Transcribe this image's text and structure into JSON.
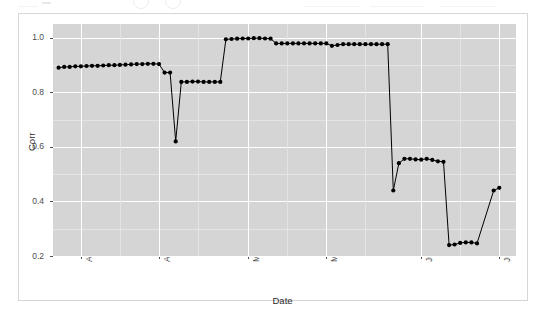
{
  "chart_data": {
    "type": "line",
    "title": "",
    "subtitle": "",
    "xlabel": "Date",
    "ylabel": "Corr",
    "ylim": [
      0.2,
      1.05
    ],
    "yticks": [
      "0.2",
      "0.4",
      "0.6",
      "0.8",
      "1.0"
    ],
    "ytick_values": [
      0.2,
      0.4,
      0.6,
      0.8,
      1.0
    ],
    "xticks": [
      "Apr 01",
      "Apr 15",
      "May 01",
      "May 15",
      "Jun 01",
      "Jun 15"
    ],
    "xtick_dates": [
      "2020-04-01",
      "2020-04-15",
      "2020-05-01",
      "2020-05-15",
      "2020-06-01",
      "2020-06-15"
    ],
    "x_range": [
      "2020-03-27",
      "2020-06-18"
    ],
    "grid": true,
    "grid_major_color": "#ffffff",
    "grid_minor_color": "#e4e4e4",
    "panel_color": "#d5d5d5",
    "point_color": "#000000",
    "line_color": "#000000",
    "marker": "filled-circle",
    "legend": "none",
    "x": [
      "2020-03-28",
      "2020-03-29",
      "2020-03-30",
      "2020-03-31",
      "2020-04-01",
      "2020-04-02",
      "2020-04-03",
      "2020-04-04",
      "2020-04-05",
      "2020-04-06",
      "2020-04-07",
      "2020-04-08",
      "2020-04-09",
      "2020-04-10",
      "2020-04-11",
      "2020-04-12",
      "2020-04-13",
      "2020-04-14",
      "2020-04-15",
      "2020-04-16",
      "2020-04-17",
      "2020-04-18",
      "2020-04-19",
      "2020-04-20",
      "2020-04-21",
      "2020-04-22",
      "2020-04-23",
      "2020-04-24",
      "2020-04-25",
      "2020-04-26",
      "2020-04-27",
      "2020-04-28",
      "2020-04-29",
      "2020-04-30",
      "2020-05-01",
      "2020-05-02",
      "2020-05-03",
      "2020-05-04",
      "2020-05-05",
      "2020-05-06",
      "2020-05-07",
      "2020-05-08",
      "2020-05-09",
      "2020-05-10",
      "2020-05-11",
      "2020-05-12",
      "2020-05-13",
      "2020-05-14",
      "2020-05-15",
      "2020-05-16",
      "2020-05-17",
      "2020-05-18",
      "2020-05-19",
      "2020-05-20",
      "2020-05-21",
      "2020-05-22",
      "2020-05-23",
      "2020-05-24",
      "2020-05-25",
      "2020-05-26",
      "2020-05-27",
      "2020-05-28",
      "2020-05-29",
      "2020-05-30",
      "2020-05-31",
      "2020-06-01",
      "2020-06-02",
      "2020-06-03",
      "2020-06-04",
      "2020-06-05",
      "2020-06-06",
      "2020-06-07",
      "2020-06-08",
      "2020-06-09",
      "2020-06-10",
      "2020-06-11",
      "2020-06-14",
      "2020-06-15"
    ],
    "values": [
      0.89,
      0.893,
      0.893,
      0.895,
      0.895,
      0.896,
      0.897,
      0.897,
      0.898,
      0.899,
      0.899,
      0.9,
      0.901,
      0.902,
      0.903,
      0.903,
      0.904,
      0.904,
      0.903,
      0.872,
      0.872,
      0.62,
      0.838,
      0.838,
      0.839,
      0.839,
      0.838,
      0.838,
      0.838,
      0.838,
      0.994,
      0.995,
      0.996,
      0.997,
      0.997,
      0.998,
      0.998,
      0.997,
      0.996,
      0.979,
      0.979,
      0.979,
      0.979,
      0.979,
      0.979,
      0.979,
      0.979,
      0.979,
      0.979,
      0.97,
      0.973,
      0.976,
      0.976,
      0.976,
      0.976,
      0.976,
      0.976,
      0.976,
      0.976,
      0.976,
      0.44,
      0.54,
      0.556,
      0.556,
      0.554,
      0.553,
      0.556,
      0.552,
      0.547,
      0.545,
      0.24,
      0.242,
      0.248,
      0.25,
      0.25,
      0.246,
      0.44,
      0.45
    ]
  }
}
